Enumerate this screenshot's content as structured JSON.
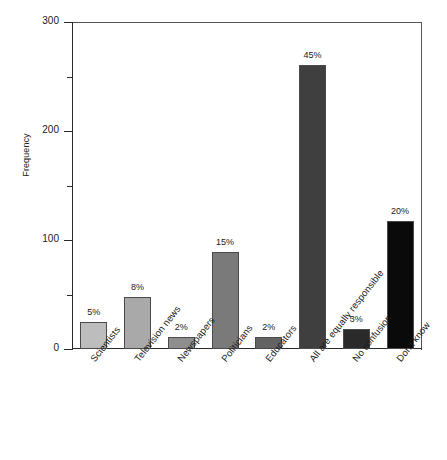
{
  "chart_data": {
    "type": "bar",
    "title": "",
    "xlabel": "",
    "ylabel": "Frequency",
    "ylim": [
      0,
      300
    ],
    "grid": false,
    "legend": false,
    "y_ticks_major": [
      "0",
      "100",
      "200",
      "300"
    ],
    "y_ticks_minor": [
      50,
      150,
      250
    ],
    "categories": [
      "Scientists",
      "Television news",
      "Newspapers",
      "Politicians",
      "Educators",
      "All are equally responsible",
      "No confusion",
      "Don't know"
    ],
    "values": [
      25,
      48,
      11,
      89,
      11,
      261,
      18,
      117
    ],
    "data_labels": [
      "5%",
      "8%",
      "2%",
      "15%",
      "2%",
      "45%",
      "3%",
      "20%"
    ],
    "bar_colors": [
      "#bdbdbd",
      "#a9a9a9",
      "#8e8e8e",
      "#7a7a7a",
      "#636363",
      "#3f3f3f",
      "#2a2a2a",
      "#0a0a0a"
    ]
  }
}
